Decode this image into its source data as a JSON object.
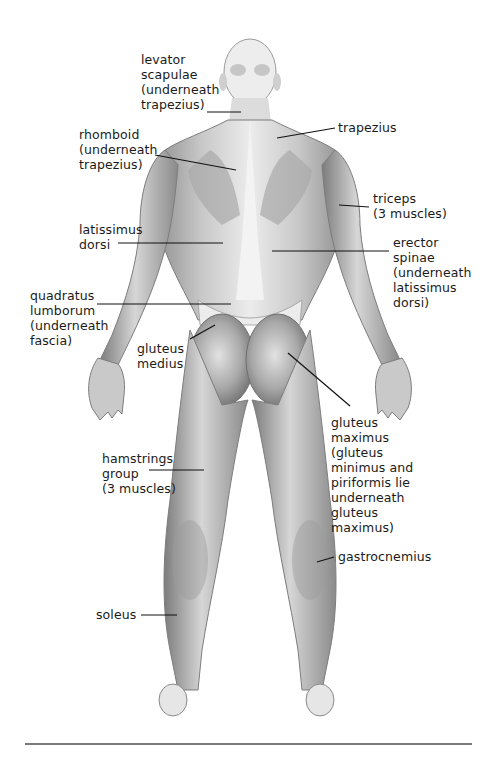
{
  "diagram": {
    "colors": {
      "skin_light": "#e9e9e9",
      "skin_mid": "#bdbdbd",
      "skin_dark": "#8a8a8a",
      "leader": "#111111",
      "rule": "#7a7a7a"
    },
    "labels": [
      {
        "id": "levator-scapulae",
        "text": "levator\nscapulae\n(underneath\ntrapezius)",
        "x": 141,
        "y": 52,
        "line": [
          [
            207,
            112
          ],
          [
            241,
            112
          ]
        ]
      },
      {
        "id": "trapezius",
        "text": "trapezius",
        "x": 338,
        "y": 120,
        "line": [
          [
            335,
            128
          ],
          [
            277,
            138
          ]
        ]
      },
      {
        "id": "rhomboid",
        "text": "rhomboid\n(underneath\ntrapezius)",
        "x": 79,
        "y": 127,
        "line": [
          [
            155,
            155
          ],
          [
            236,
            170
          ]
        ]
      },
      {
        "id": "triceps",
        "text": "triceps\n(3 muscles)",
        "x": 373,
        "y": 191,
        "line": [
          [
            369,
            207
          ],
          [
            339,
            205
          ]
        ]
      },
      {
        "id": "latissimus-dorsi",
        "text": "latissimus\ndorsi",
        "x": 79,
        "y": 222,
        "line": [
          [
            118,
            243
          ],
          [
            223,
            243
          ]
        ]
      },
      {
        "id": "erector-spinae",
        "text": "erector\nspinae\n(underneath\nlatissimus\ndorsi)",
        "x": 393,
        "y": 235,
        "line": [
          [
            389,
            251
          ],
          [
            272,
            251
          ]
        ]
      },
      {
        "id": "quadratus-lumborum",
        "text": "quadratus\nlumborum\n(underneath\nfascia)",
        "x": 30,
        "y": 288,
        "line": [
          [
            97,
            304
          ],
          [
            231,
            304
          ]
        ]
      },
      {
        "id": "gluteus-medius",
        "text": "gluteus\nmedius",
        "x": 137,
        "y": 341,
        "line": [
          [
            190,
            339
          ],
          [
            215,
            325
          ]
        ]
      },
      {
        "id": "gluteus-maximus",
        "text": "gluteus\nmaximus\n(gluteus\nminimus and\npiriformis lie\nunderneath\ngluteus\nmaximus)",
        "x": 331,
        "y": 415,
        "line": [
          [
            350,
            406
          ],
          [
            288,
            353
          ]
        ]
      },
      {
        "id": "hamstrings-group",
        "text": "hamstrings\ngroup\n(3 muscles)",
        "x": 102,
        "y": 451,
        "line": [
          [
            149,
            470
          ],
          [
            204,
            470
          ]
        ]
      },
      {
        "id": "gastrocnemius",
        "text": "gastrocnemius",
        "x": 338,
        "y": 549,
        "line": [
          [
            334,
            557
          ],
          [
            317,
            562
          ]
        ]
      },
      {
        "id": "soleus",
        "text": "soleus",
        "x": 96,
        "y": 607,
        "line": [
          [
            141,
            615
          ],
          [
            177,
            615
          ]
        ]
      }
    ]
  }
}
